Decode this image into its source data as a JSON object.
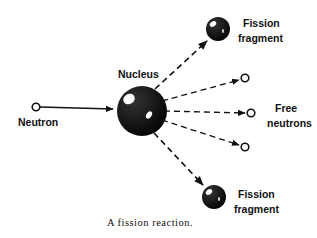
{
  "diagram": {
    "caption": "A fission reaction.",
    "labels": {
      "neutron": "Neutron",
      "nucleus": "Nucleus",
      "fragment_top_line1": "Fission",
      "fragment_top_line2": "fragment",
      "free_line1": "Free",
      "free_line2": "neutrons",
      "fragment_bottom_line1": "Fission",
      "fragment_bottom_line2": "fragment"
    },
    "nodes": [
      {
        "id": "incoming-neutron",
        "type": "neutron",
        "label": "Neutron"
      },
      {
        "id": "nucleus",
        "type": "nucleus",
        "label": "Nucleus"
      },
      {
        "id": "fragment-top",
        "type": "fission-fragment",
        "label": "Fission fragment"
      },
      {
        "id": "free-neutron-1",
        "type": "neutron",
        "label": "Free neutrons"
      },
      {
        "id": "free-neutron-2",
        "type": "neutron",
        "label": "Free neutrons"
      },
      {
        "id": "free-neutron-3",
        "type": "neutron",
        "label": "Free neutrons"
      },
      {
        "id": "fragment-bottom",
        "type": "fission-fragment",
        "label": "Fission fragment"
      }
    ],
    "edges": [
      {
        "from": "incoming-neutron",
        "to": "nucleus",
        "style": "solid"
      },
      {
        "from": "nucleus",
        "to": "fragment-top",
        "style": "dashed"
      },
      {
        "from": "nucleus",
        "to": "free-neutron-1",
        "style": "dashed"
      },
      {
        "from": "nucleus",
        "to": "free-neutron-2",
        "style": "dashed"
      },
      {
        "from": "nucleus",
        "to": "free-neutron-3",
        "style": "dashed"
      },
      {
        "from": "nucleus",
        "to": "fragment-bottom",
        "style": "dashed"
      }
    ],
    "colors": {
      "ink": "#111111",
      "background": "#ffffff"
    }
  }
}
